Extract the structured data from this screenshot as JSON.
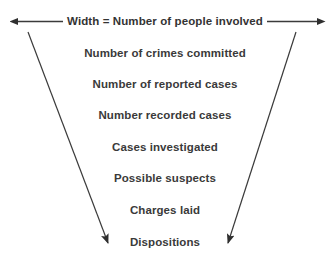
{
  "diagram": {
    "title_arrow": {
      "label": "Width = Number of people involved",
      "left_arrowhead": "arrow-left-icon",
      "right_arrowhead": "arrow-right-icon"
    },
    "stages": [
      {
        "label": "Number of crimes committed",
        "y": 47
      },
      {
        "label": "Number of reported cases",
        "y": 78
      },
      {
        "label": "Number recorded cases",
        "y": 109
      },
      {
        "label": "Cases investigated",
        "y": 141
      },
      {
        "label": "Possible suspects",
        "y": 172
      },
      {
        "label": "Charges laid",
        "y": 204
      },
      {
        "label": "Dispositions",
        "y": 236
      }
    ],
    "funnel_arrows": {
      "left": {
        "name": "funnel-left-arrow",
        "x1": 28,
        "y1": 32,
        "x2": 110,
        "y2": 247
      },
      "right": {
        "name": "funnel-right-arrow",
        "x1": 296,
        "y1": 32,
        "x2": 227,
        "y2": 247
      }
    },
    "colors": {
      "line": "#3b3b3b",
      "text": "#3a3a3a",
      "background": "#ffffff"
    }
  }
}
